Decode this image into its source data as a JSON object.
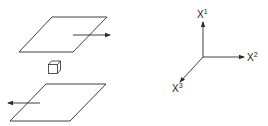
{
  "diagram": {
    "colors": {
      "stroke": "#2a2a2a",
      "background": "#ffffff"
    },
    "left_figure": {
      "top_plane": {
        "arrow_direction": "right"
      },
      "cube": {
        "label": ""
      },
      "bottom_plane": {
        "arrow_direction": "left"
      }
    },
    "axes": {
      "x1": {
        "base": "X",
        "sup": "1"
      },
      "x2": {
        "base": "X",
        "sup": "2"
      },
      "x3": {
        "base": "X",
        "sup": "3"
      }
    }
  }
}
